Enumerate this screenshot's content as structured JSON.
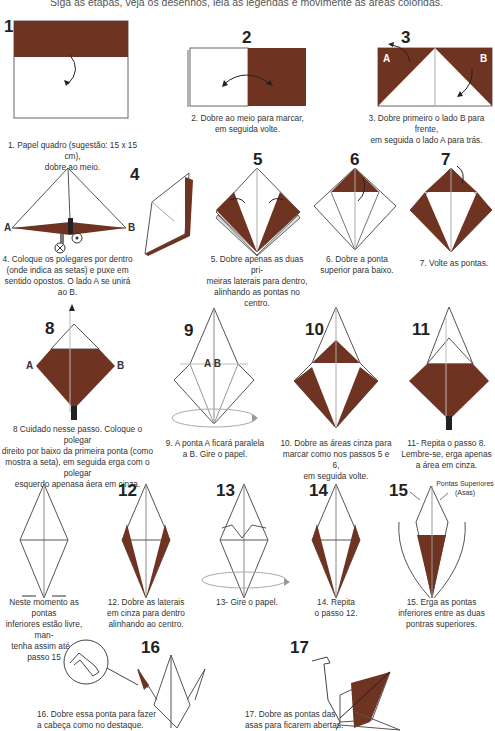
{
  "header": {
    "instructions": "Siga as etapas, veja os desenhos, leia as legendas e movimente as áreas coloridas."
  },
  "colors": {
    "paper_colored": "#6f3322",
    "paper_white": "#ffffff",
    "line": "#555555",
    "crease": "#aaaaaa"
  },
  "steps": [
    {
      "number": "1",
      "caption_1": "1.  Papel quadro (sugestão: 15 x 15 cm),",
      "caption_2": "dobre ao meio."
    },
    {
      "number": "2",
      "caption_1": "2. Dobre ao meio para marcar,",
      "caption_2": "em seguida volte."
    },
    {
      "number": "3",
      "caption_1": "3. Dobre primeiro o lado B para frente,",
      "caption_2": "em seguida o lado A para trás.",
      "label_a": "A",
      "label_b": "B"
    },
    {
      "number": "4",
      "caption_1": "4. Coloque os polegares por dentro",
      "caption_2": "(onde indica as setas) e puxe em",
      "caption_3": "sentido opostos. O lado A se unirá ao B.",
      "label_a": "A",
      "label_b": "B"
    },
    {
      "number": "5",
      "caption_1": "5. Dobre apenas as duas pri-",
      "caption_2": "meiras laterais para dentro,",
      "caption_3": "alinhando as pontas no centro."
    },
    {
      "number": "6",
      "caption_1": "6. Dobre a ponta",
      "caption_2": "superior para baixo."
    },
    {
      "number": "7",
      "caption_1": "7. Volte as pontas."
    },
    {
      "number": "8",
      "caption_1": "8 Cuidado nesse passo. Coloque o polegar",
      "caption_2": "direito por baixo da primeira ponta (como",
      "caption_3": "mostra a seta), em seguida erga com o polegar",
      "caption_4": "esquerdo apenasa áera em cinza.",
      "label_a": "A",
      "label_b": "B"
    },
    {
      "number": "9",
      "caption_1": "9. A ponta A ficará paralela",
      "caption_2": "a B. Gire o papel.",
      "label_ab": "A B"
    },
    {
      "number": "10",
      "caption_1": "10. Dobre as áreas cinza para",
      "caption_2": "marcar como nos passos 5 e 6,",
      "caption_3": "em seguida volte."
    },
    {
      "number": "11",
      "caption_1": "11- Repita o passo 8.",
      "caption_2": "Lembre-se, erga apenas",
      "caption_3": "a área em cinza."
    },
    {
      "number": "",
      "caption_1": "Neste momento as pontas",
      "caption_2": "inferiores estão livre, man-",
      "caption_3": "tenha assim até o passo 15"
    },
    {
      "number": "12",
      "caption_1": "12. Dobre as laterais",
      "caption_2": "em cinza para dentro",
      "caption_3": "alinhando ao centro."
    },
    {
      "number": "13",
      "caption_1": "13- Gire o papel."
    },
    {
      "number": "14",
      "caption_1": "14. Repita",
      "caption_2": "o passo 12."
    },
    {
      "number": "15",
      "caption_1": "15. Erga as pontas",
      "caption_2": "inferiores entre as duas",
      "caption_3": "pontras superiores.",
      "annotation_1": "Pontas Superiores",
      "annotation_2": "(Asas)"
    },
    {
      "number": "16",
      "caption_1": "16. Dobre essa ponta para fazer",
      "caption_2": "a cabeça como no destaque."
    },
    {
      "number": "17",
      "caption_1": "17. Dobre as pontas das",
      "caption_2": "asas para ficarem abertas."
    }
  ]
}
